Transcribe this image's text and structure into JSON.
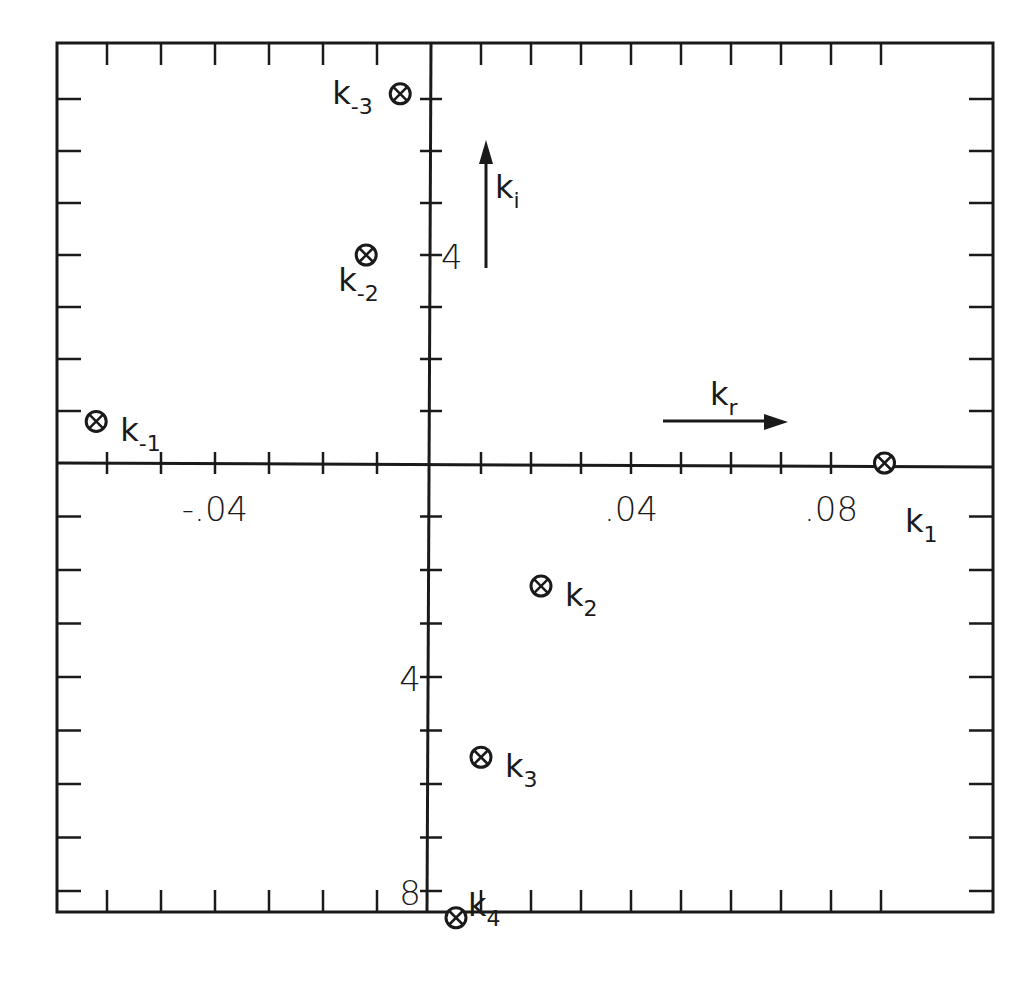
{
  "chart_data": {
    "type": "scatter",
    "title": "",
    "xlabel": "k_r",
    "ylabel": "k_i",
    "xlim": [
      -0.069,
      0.104
    ],
    "ylim": [
      -8.6,
      8.1
    ],
    "grid": false,
    "legend": null,
    "x_tick_labels": [
      {
        "value": -0.04,
        "text": "-.04"
      },
      {
        "value": 0.04,
        "text": ".04"
      },
      {
        "value": 0.08,
        "text": ".08"
      }
    ],
    "y_tick_labels": [
      {
        "value": 4,
        "text": "4",
        "side": "upper"
      },
      {
        "value": -4,
        "text": "4",
        "side": "lower"
      },
      {
        "value": -8,
        "text": "8",
        "side": "lower"
      }
    ],
    "x_minor_tick_step": 0.01,
    "y_minor_tick_step": 1,
    "axis_arrows": [
      {
        "name": "k-i-arrow",
        "label": "k",
        "sub": "i",
        "direction": "up"
      },
      {
        "name": "k-r-arrow",
        "label": "k",
        "sub": "r",
        "direction": "right"
      }
    ],
    "points": [
      {
        "id": "k-3",
        "label": "k",
        "sub": "-3",
        "x": -0.0057,
        "y": 7.1,
        "label_pos": "left"
      },
      {
        "id": "k-2",
        "label": "k",
        "sub": "-2",
        "x": -0.012,
        "y": 4.0,
        "label_pos": "below-left"
      },
      {
        "id": "k-1",
        "label": "k",
        "sub": "-1",
        "x": -0.062,
        "y": 0.8,
        "label_pos": "right"
      },
      {
        "id": "k1",
        "label": "k",
        "sub": "1",
        "x": 0.0907,
        "y": 0.0,
        "label_pos": "below-left"
      },
      {
        "id": "k2",
        "label": "k",
        "sub": "2",
        "x": 0.022,
        "y": -2.3,
        "label_pos": "right"
      },
      {
        "id": "k3",
        "label": "k",
        "sub": "3",
        "x": 0.01,
        "y": -5.5,
        "label_pos": "right"
      },
      {
        "id": "k4",
        "label": "k",
        "sub": "4",
        "x": 0.005,
        "y": -8.5,
        "label_pos": "upper-right"
      }
    ],
    "marker": "circle-x"
  },
  "colors": {
    "ink": "#1a1a1a",
    "background": "#ffffff"
  }
}
